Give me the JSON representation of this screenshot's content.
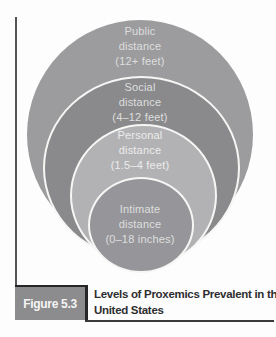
{
  "figure": {
    "box_label": "Figure 5.3",
    "title_lines": [
      "Levels of Proxemics Prevalent in the",
      "United States"
    ]
  },
  "diagram": {
    "type": "nested-circles",
    "title": "Levels of Proxemics Prevalent in the United States",
    "rings": [
      {
        "id": "public",
        "name": "Public",
        "word": "distance",
        "range": "(12+ feet)",
        "color": "#9c9c9e"
      },
      {
        "id": "social",
        "name": "Social",
        "word": "distance",
        "range": "(4–12 feet)",
        "color": "#8a8a8c"
      },
      {
        "id": "personal",
        "name": "Personal",
        "word": "distance",
        "range": "(1.5–4 feet)",
        "color": "#b2b2b4"
      },
      {
        "id": "intimate",
        "name": "Intimate",
        "word": "distance",
        "range": "(0–18 inches)",
        "color": "#96969a"
      }
    ],
    "label_text_color": "#dedede",
    "ring_outline_color": "#f6f6f4"
  },
  "colors": {
    "figure_box_bg": "#8c8c8e",
    "figure_box_text": "#f5f5f5",
    "rule": "#39393b",
    "title_text": "#2e2e30"
  }
}
